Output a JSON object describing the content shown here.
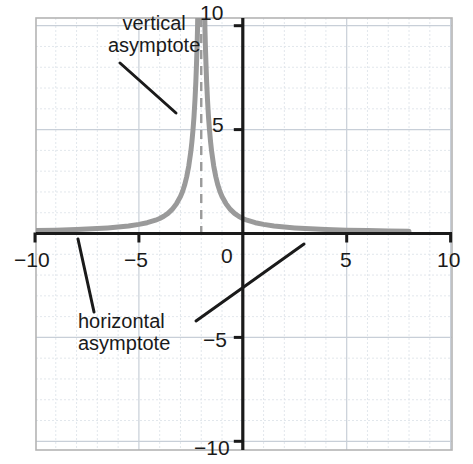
{
  "chart_data": {
    "type": "line",
    "title": "",
    "xlabel": "",
    "ylabel": "",
    "xlim": [
      -11.3,
      10.1
    ],
    "ylim": [
      -10.4,
      10.3
    ],
    "grid": true,
    "minor_grid": true,
    "grid_step": 1,
    "legend": null,
    "function": "rational function with vertical asymptote at x = -2 and horizontal asymptote at y = 0",
    "x_ticks": [
      -10,
      -5,
      0,
      5,
      10
    ],
    "x_tick_labels": [
      "−10",
      "−5",
      "0",
      "5",
      "10"
    ],
    "y_ticks": [
      -10,
      -5,
      0,
      5,
      10
    ],
    "y_tick_labels": [
      "−10",
      "−5",
      "0",
      "5",
      "10"
    ],
    "series": [
      {
        "name": "curve",
        "color": "#9a9a9a",
        "style": "solid",
        "width": 5,
        "branches": [
          {
            "name": "left-branch",
            "comment": "approaches y=0 from above on the far left, rises steeply to +infinity as x approaches -2 from the left",
            "points": [
              [
                -11.3,
                0.12
              ],
              [
                -10.0,
                0.14
              ],
              [
                -9.0,
                0.16
              ],
              [
                -8.0,
                0.19
              ],
              [
                -7.0,
                0.24
              ],
              [
                -6.5,
                0.27
              ],
              [
                -6.0,
                0.31
              ],
              [
                -5.5,
                0.36
              ],
              [
                -5.0,
                0.44
              ],
              [
                -4.6,
                0.52
              ],
              [
                -4.2,
                0.64
              ],
              [
                -4.0,
                0.72
              ],
              [
                -3.8,
                0.83
              ],
              [
                -3.6,
                0.97
              ],
              [
                -3.4,
                1.16
              ],
              [
                -3.2,
                1.42
              ],
              [
                -3.0,
                1.78
              ],
              [
                -2.9,
                2.02
              ],
              [
                -2.8,
                2.33
              ],
              [
                -2.7,
                2.73
              ],
              [
                -2.6,
                3.25
              ],
              [
                -2.5,
                3.95
              ],
              [
                -2.45,
                4.4
              ],
              [
                -2.4,
                4.95
              ],
              [
                -2.35,
                5.6
              ],
              [
                -2.3,
                6.45
              ],
              [
                -2.26,
                7.3
              ],
              [
                -2.23,
                8.1
              ],
              [
                -2.2,
                9.0
              ],
              [
                -2.18,
                9.8
              ],
              [
                -2.17,
                10.4
              ]
            ]
          },
          {
            "name": "right-branch",
            "comment": "descends from +infinity just right of x=-2 and flattens toward y=0 ending near x=8",
            "points": [
              [
                -1.83,
                10.4
              ],
              [
                -1.82,
                9.8
              ],
              [
                -1.8,
                9.0
              ],
              [
                -1.77,
                8.1
              ],
              [
                -1.74,
                7.3
              ],
              [
                -1.7,
                6.45
              ],
              [
                -1.65,
                5.6
              ],
              [
                -1.6,
                4.95
              ],
              [
                -1.55,
                4.4
              ],
              [
                -1.5,
                3.95
              ],
              [
                -1.4,
                3.25
              ],
              [
                -1.3,
                2.73
              ],
              [
                -1.2,
                2.33
              ],
              [
                -1.1,
                2.02
              ],
              [
                -1.0,
                1.78
              ],
              [
                -0.8,
                1.42
              ],
              [
                -0.6,
                1.16
              ],
              [
                -0.4,
                0.97
              ],
              [
                -0.2,
                0.83
              ],
              [
                0.0,
                0.72
              ],
              [
                0.2,
                0.64
              ],
              [
                0.6,
                0.52
              ],
              [
                1.0,
                0.44
              ],
              [
                1.5,
                0.36
              ],
              [
                2.0,
                0.31
              ],
              [
                2.5,
                0.27
              ],
              [
                3.0,
                0.24
              ],
              [
                4.0,
                0.19
              ],
              [
                5.0,
                0.16
              ],
              [
                6.0,
                0.14
              ],
              [
                7.0,
                0.12
              ],
              [
                8.0,
                0.11
              ]
            ]
          }
        ]
      }
    ],
    "asymptotes": [
      {
        "name": "vertical-asymptote",
        "orientation": "vertical",
        "value": -2,
        "style": "dashed",
        "color": "#9a9a9a",
        "label": "vertical\nasymptote"
      },
      {
        "name": "horizontal-asymptote",
        "orientation": "horizontal",
        "value": 0,
        "style": "solid-axis",
        "color": "#9a9a9a",
        "label": "horizontal\nasymptote"
      }
    ],
    "annotations": [
      {
        "name": "vertical-asymptote-annotation",
        "line1": "vertical",
        "line2": "asymptote",
        "text_x": 108,
        "text_y": 12,
        "leader": {
          "x1": 120,
          "y1": 63,
          "x2": 176,
          "y2": 113
        }
      },
      {
        "name": "horizontal-asymptote-annotation",
        "line1": "horizontal",
        "line2": "asymptote",
        "text_x": 78,
        "text_y": 310,
        "leaders": [
          {
            "x1": 78,
            "y1": 239,
            "x2": 94,
            "y2": 312
          },
          {
            "x1": 196,
            "y1": 321,
            "x2": 304,
            "y2": 244
          }
        ]
      }
    ]
  },
  "axes": {
    "x_axis_name": "x-axis",
    "y_axis_name": "y-axis",
    "axis_color": "#1a1a1a",
    "border_color": "#b4b4b4",
    "grid_color": "#c8cfd8",
    "minor_grid_color": "#dfe4ea",
    "curve_color": "#9a9a9a",
    "annotation_color": "#1a1a1a"
  },
  "tick_labels": {
    "x": [
      {
        "name": "x-tick-label-neg10",
        "text": "−10",
        "x": 14,
        "y": 249
      },
      {
        "name": "x-tick-label-neg5",
        "text": "−5",
        "x": 124,
        "y": 249
      },
      {
        "name": "x-tick-label-0",
        "text": "0",
        "x": 221,
        "y": 245
      },
      {
        "name": "x-tick-label-5",
        "text": "5",
        "x": 340,
        "y": 249
      },
      {
        "name": "x-tick-label-10",
        "text": "10",
        "x": 437,
        "y": 249
      }
    ],
    "y": [
      {
        "name": "y-tick-label-10",
        "text": "10",
        "x": 200,
        "y": 2
      },
      {
        "name": "y-tick-label-5",
        "text": "5",
        "x": 212,
        "y": 114
      },
      {
        "name": "y-tick-label-neg5",
        "text": "−5",
        "x": 203,
        "y": 329
      },
      {
        "name": "y-tick-label-neg10",
        "text": "−10",
        "x": 194,
        "y": 437
      }
    ]
  }
}
